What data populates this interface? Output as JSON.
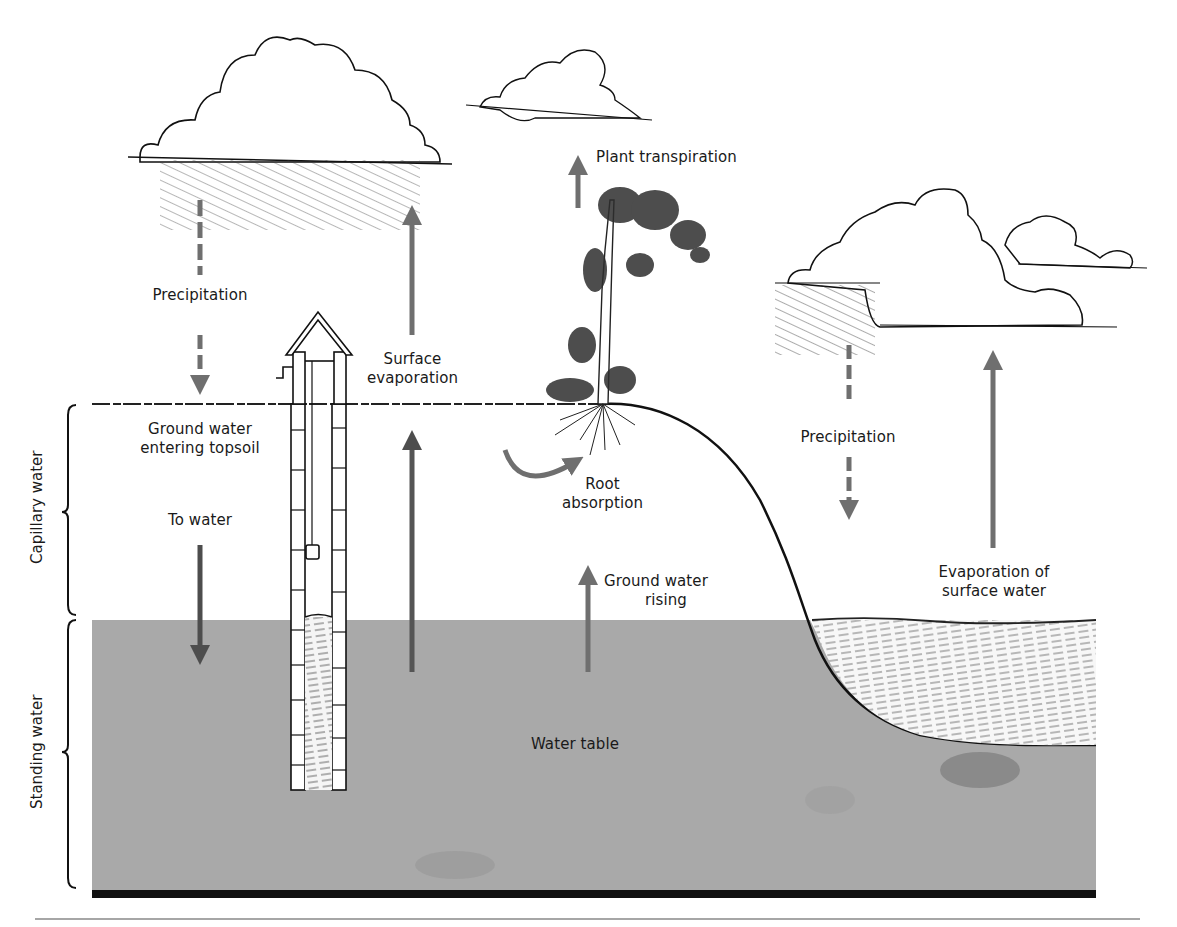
{
  "diagram": {
    "type": "water cycle / ground water cross-section",
    "colors": {
      "water_table_fill": "#a9a9a9",
      "arrow_gray": "#6f6f6f",
      "arrow_dark": "#4d4d4d",
      "line_black": "#111111",
      "background": "#ffffff"
    },
    "side_labels": {
      "capillary": "Capillary water",
      "standing": "Standing water"
    },
    "labels": {
      "precip_left": "Precipitation",
      "surface_evap_1": "Surface",
      "surface_evap_2": "evaporation",
      "plant_transpiration": "Plant transpiration",
      "gw_entering_1": "Ground water",
      "gw_entering_2": "entering topsoil",
      "to_water": "To water",
      "root_1": "Root",
      "root_2": "absorption",
      "gw_rising_1": "Ground water",
      "gw_rising_2": "rising",
      "precip_right": "Precipitation",
      "evap_surface_1": "Evaporation of",
      "evap_surface_2": "surface water",
      "water_table": "Water table"
    },
    "elements": [
      "cloud-left-raining",
      "cloud-center-small",
      "cloud-right-raining",
      "cloud-far-right",
      "well",
      "tree",
      "hill-slope",
      "pond"
    ]
  }
}
